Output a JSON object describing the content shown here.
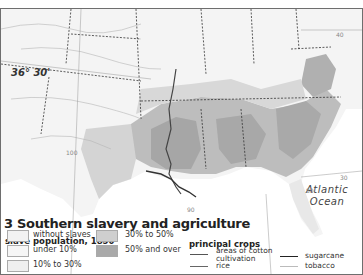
{
  "map": {
    "title": "3 Southern slavery and agriculture",
    "parallel_label": "36° 30'",
    "ocean_label_line1": "Atlantic",
    "ocean_label_line2": "Ocean",
    "grid_labels": {
      "lat_40": "40",
      "lat_30": "30",
      "lon_80": "80",
      "lon_90": "90",
      "lon_100": "100"
    },
    "colors": {
      "background": "#f4f4f4",
      "without_slaves": "#f2f2f2",
      "under_10": "#ececec",
      "ten_to_30": "#dcdcdc",
      "thirty_to_50": "#c4c4c4",
      "fifty_and_over": "#a8a8a8",
      "water": "#ffffff",
      "border": "#6e6e6e"
    }
  },
  "legend": {
    "subtitle": "slave population, 1850",
    "items": [
      {
        "label": "without slaves",
        "color": "#f2f2f2"
      },
      {
        "label": "under 10%",
        "color": "#f6f6f6"
      },
      {
        "label": "10% to 30%",
        "color": "#efefef"
      },
      {
        "label": "30% to 50%",
        "color": "#cfcfcf"
      },
      {
        "label": "50% and over",
        "color": "#a9a9a9"
      }
    ]
  },
  "crops": {
    "title": "principal crops",
    "items": [
      {
        "label_line1": "areas of cotton",
        "label_line2": "cultivation",
        "color": "#555555"
      },
      {
        "label_line1": "rice",
        "label_line2": "",
        "color": "#666666"
      },
      {
        "label_line1": "sugarcane",
        "label_line2": "",
        "color": "#222222"
      },
      {
        "label_line1": "tobacco",
        "label_line2": "",
        "color": "#bbbbbb"
      }
    ]
  }
}
